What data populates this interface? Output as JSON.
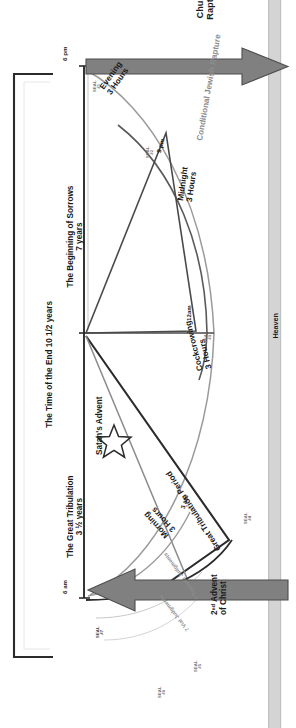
{
  "diagram": {
    "heaven_band_label": "Heaven",
    "colors": {
      "arrow_fill": "#808080",
      "arrow_stroke": "#4d4d4d",
      "heaven_band": "#d4d4d4",
      "timeline_line": "#2b2b2b",
      "curve_dark": "#4a4a4a",
      "curve_light": "#9a9a9a",
      "text_gray": "#8d8d8d",
      "text_dark": "#1a1a1a"
    },
    "outer_bracket": {
      "label": "The Time of the End  10 1/2 years"
    },
    "timeline_segments": [
      {
        "label": "The Beginning of Sorrows",
        "sublabel": "7 years"
      },
      {
        "label": "The Great Tribulation",
        "sublabel": "3 ½ years"
      }
    ],
    "time_markers": [
      {
        "label": "6 pm"
      },
      {
        "label": "9 pm"
      },
      {
        "label": "12am"
      },
      {
        "label": "3 am"
      },
      {
        "label": "6 am"
      }
    ],
    "watches": [
      {
        "name": "Evening",
        "duration": "3 Hours"
      },
      {
        "name": "Midnight",
        "duration": "3 Hours"
      },
      {
        "name": "Cockcrowing",
        "duration": "3 Hours"
      },
      {
        "name": "Morning",
        "duration": "3 Hours"
      }
    ],
    "seals": [
      {
        "line1": "SEAL",
        "line2": "#1"
      },
      {
        "line1": "SEAL",
        "line2": "#2"
      },
      {
        "line1": "SEAL",
        "line2": "#3"
      },
      {
        "line1": "SEAL",
        "line2": "#4"
      },
      {
        "line1": "SEAL",
        "line2": "#5"
      },
      {
        "line1": "SEAL",
        "line2": "#6"
      },
      {
        "line1": "SEAL",
        "line2": "#7"
      }
    ],
    "events": {
      "church_rapture": "Church\nRapture",
      "church_rapture_l1": "Church",
      "church_rapture_l2": "Rapture",
      "conditional_jewish_rapture": "Conditional Jewish Rapture",
      "satans_advent": "Satan's Advent",
      "second_advent_l1": "2ⁿᵈ Advent",
      "second_advent_l2": "of Christ",
      "great_tribulation_period": "Great Tribulation Period",
      "trumpet_judgments": "7 Trumpet Judgments",
      "vial_judgments": "7 Vial Judgments"
    },
    "icons": {
      "star": "star-icon",
      "rapture_arrow": "arrow-right-icon",
      "advent_arrow": "arrow-left-icon"
    }
  }
}
